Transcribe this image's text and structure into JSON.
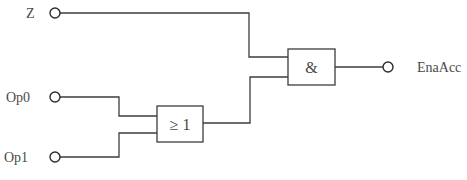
{
  "diagram": {
    "type": "logic-circuit",
    "colors": {
      "line": "#3c3c3c",
      "text": "#4a4a4a",
      "background": "#ffffff"
    },
    "inputs": [
      {
        "id": "Z",
        "label": "Z"
      },
      {
        "id": "Op0",
        "label": "Op0"
      },
      {
        "id": "Op1",
        "label": "Op1"
      }
    ],
    "gates": [
      {
        "id": "or",
        "symbol": "≥ 1",
        "function": "OR",
        "inputs": [
          "Op0",
          "Op1"
        ]
      },
      {
        "id": "and",
        "symbol": "&",
        "function": "AND",
        "inputs": [
          "Z",
          "or"
        ]
      }
    ],
    "outputs": [
      {
        "id": "EnaAcc",
        "label": "EnaAcc",
        "source": "and"
      }
    ]
  }
}
